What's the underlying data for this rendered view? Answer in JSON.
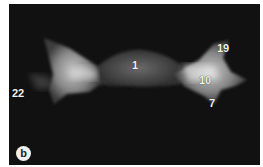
{
  "figure": {
    "panel_label": "b",
    "annotations": [
      {
        "id": "label-1",
        "text": "1",
        "x": 123,
        "y": 56
      },
      {
        "id": "label-19",
        "text": "19",
        "x": 208,
        "y": 39
      },
      {
        "id": "label-10",
        "text": "10",
        "x": 190,
        "y": 71
      },
      {
        "id": "label-7",
        "text": "7",
        "x": 200,
        "y": 94
      },
      {
        "id": "label-22",
        "text": "22",
        "x": 3,
        "y": 84
      }
    ],
    "colors": {
      "background": "#111111",
      "bone": "#d8d8d8",
      "label": "#f2f2f2",
      "margin": "#ffffff"
    }
  }
}
